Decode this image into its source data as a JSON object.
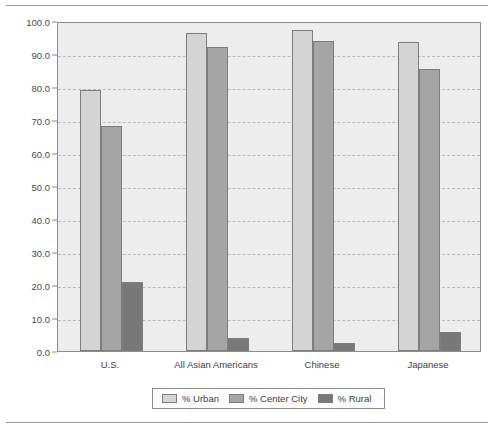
{
  "chart_data": {
    "type": "bar",
    "title": "",
    "xlabel": "",
    "ylabel": "Percentages",
    "ylim": [
      0,
      100
    ],
    "ytick_step": 10,
    "ytick_labels": [
      "0.0",
      "10.0",
      "20.0",
      "30.0",
      "40.0",
      "50.0",
      "60.0",
      "70.0",
      "80.0",
      "90.0",
      "100.0"
    ],
    "grid": true,
    "legend_position": "bottom-center",
    "categories": [
      "U.S.",
      "All Asian Americans",
      "Chinese",
      "Japanese"
    ],
    "series": [
      {
        "name": "% Urban",
        "color": "#d4d4d4",
        "values": [
          79.0,
          96.5,
          97.3,
          93.5
        ]
      },
      {
        "name": "% Center City",
        "color": "#a5a5a5",
        "values": [
          68.3,
          92.0,
          94.0,
          85.5
        ]
      },
      {
        "name": "% Rural",
        "color": "#787878",
        "values": [
          21.0,
          3.8,
          2.5,
          5.8
        ]
      }
    ]
  },
  "style": {
    "plot_background": "#ededed",
    "axis_color": "#8c8c8c",
    "grid_color": "#b9b9b9",
    "text_color": "#3e3e3e",
    "rule_color": "#9a9a9a"
  }
}
